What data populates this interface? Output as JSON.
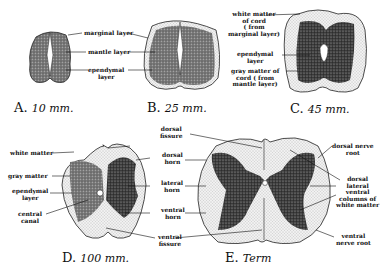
{
  "figure": {
    "panels": [
      {
        "id": "A",
        "letter": "A.",
        "stage": "10 mm.",
        "labels": [
          "marginal layer",
          "mantle layer",
          "ependymal layer"
        ]
      },
      {
        "id": "B",
        "letter": "B.",
        "stage": "25 mm.",
        "labels": []
      },
      {
        "id": "C",
        "letter": "C.",
        "stage": "45 mm.",
        "labels": [
          "white matter of cord (from marginal layer)",
          "ependymal layer",
          "gray matter of cord (from mantle layer)"
        ]
      },
      {
        "id": "D",
        "letter": "D.",
        "stage": "100 mm.",
        "labels": [
          "white matter",
          "gray matter",
          "ependymal layer",
          "central canal"
        ]
      },
      {
        "id": "E",
        "letter": "E.",
        "stage": "Term",
        "labels": [
          "dorsal nerve root",
          "dorsal lateral ventral columns of white matter",
          "ventral nerve root"
        ]
      }
    ],
    "shared_labels": [
      "dorsal fissure",
      "dorsal horn",
      "lateral horn",
      "ventral horn",
      "ventral fissure"
    ]
  },
  "labels": {
    "a_marginal": "marginal layer",
    "a_mantle": "mantle layer",
    "a_ependymal_1": "ependymal",
    "a_ependymal_2": "layer",
    "c_white_1": "white matter",
    "c_white_2": "of cord",
    "c_white_3": "( from",
    "c_white_4": "marginal layer)",
    "c_epend_1": "ependymal",
    "c_epend_2": "layer",
    "c_gray_1": "gray matter of",
    "c_gray_2": "cord ( from",
    "c_gray_3": "mantle layer)",
    "d_white": "white matter",
    "d_gray": "gray matter",
    "d_epend_1": "ependymal",
    "d_epend_2": "layer",
    "d_canal_1": "central",
    "d_canal_2": "canal",
    "dorsal_fissure_1": "dorsal",
    "dorsal_fissure_2": "fissure",
    "dorsal_horn_1": "dorsal",
    "dorsal_horn_2": "horn",
    "lateral_horn_1": "lateral",
    "lateral_horn_2": "horn",
    "ventral_horn_1": "ventral",
    "ventral_horn_2": "horn",
    "ventral_fissure_1": "ventral",
    "ventral_fissure_2": "fissure",
    "e_dnr_1": "dorsal nerve",
    "e_dnr_2": "root",
    "e_cols_1": "dorsal",
    "e_cols_2": "lateral",
    "e_cols_3": "ventral",
    "e_cols_4": "columns of",
    "e_cols_5": "white matter",
    "e_vnr_1": "ventral",
    "e_vnr_2": "nerve root"
  },
  "captions": {
    "A_letter": "A.",
    "A_stage": "10 mm.",
    "B_letter": "B.",
    "B_stage": "25 mm.",
    "C_letter": "C.",
    "C_stage": "45 mm.",
    "D_letter": "D.",
    "D_stage": "100 mm.",
    "E_letter": "E.",
    "E_stage": "Term"
  }
}
